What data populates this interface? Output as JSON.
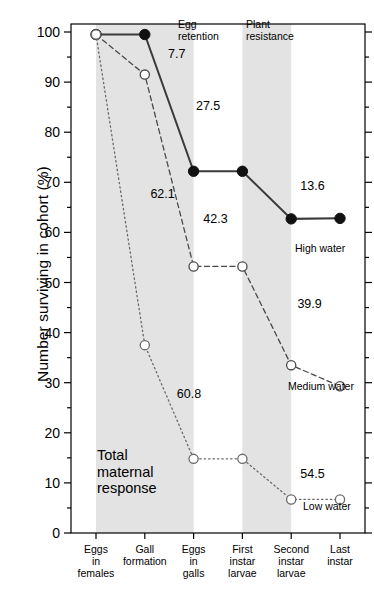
{
  "chart_data": {
    "type": "line",
    "title": "",
    "xlabel": "",
    "ylabel": "Number surviving in cohort (%)",
    "ylim": [
      0,
      100
    ],
    "ytick_step": 10,
    "yminor_step": 5,
    "grid": false,
    "legend_position": "inline-right",
    "categories": [
      "Eggs in females",
      "Gall formation",
      "Eggs in galls",
      "First instar larvae",
      "Second instar larvae",
      "Last instar"
    ],
    "category_lines": [
      [
        "Eggs",
        "in",
        "females"
      ],
      [
        "Gall",
        "formation"
      ],
      [
        "Eggs",
        "in",
        "galls"
      ],
      [
        "First",
        "instar",
        "larvae"
      ],
      [
        "Second",
        "instar",
        "larvae"
      ],
      [
        "Last",
        "instar"
      ]
    ],
    "yticks": [
      0,
      10,
      20,
      30,
      40,
      50,
      60,
      70,
      80,
      90,
      100
    ],
    "series": [
      {
        "name": "High water",
        "marker": "filled-circle",
        "line_style": "solid",
        "values": [
          99.5,
          99.5,
          72.2,
          72.2,
          62.7,
          62.8
        ],
        "label": "High water"
      },
      {
        "name": "Medium water",
        "marker": "open-circle",
        "line_style": "dashed",
        "values": [
          99.5,
          91.5,
          53.2,
          53.2,
          33.5,
          29.3
        ],
        "label": "Medium water"
      },
      {
        "name": "Low water",
        "marker": "open-circle",
        "line_style": "dotted",
        "values": [
          99.5,
          37.5,
          14.8,
          14.8,
          6.7,
          6.7
        ],
        "label": "Low water"
      }
    ],
    "annotations": [
      {
        "text": "7.7",
        "x_pct": 33.0,
        "y_value": 95.5,
        "series": "Medium water"
      },
      {
        "text": "27.5",
        "x_pct": 42.5,
        "y_value": 85.0,
        "series": "High water"
      },
      {
        "text": "62.1",
        "x_pct": 27.0,
        "y_value": 67.5,
        "series": "Low water"
      },
      {
        "text": "42.3",
        "x_pct": 45.0,
        "y_value": 62.5,
        "series": "Medium water"
      },
      {
        "text": "13.6",
        "x_pct": 78.0,
        "y_value": 69.0,
        "series": "High water"
      },
      {
        "text": "60.8",
        "x_pct": 36.0,
        "y_value": 27.5,
        "series": "Low water"
      },
      {
        "text": "39.9",
        "x_pct": 77.0,
        "y_value": 45.5,
        "series": "Medium water"
      },
      {
        "text": "54.5",
        "x_pct": 78.0,
        "y_value": 11.5,
        "series": "Low water"
      }
    ],
    "shaded_bands": [
      {
        "label": "Egg retention",
        "label_lines": [
          "Egg",
          "retention"
        ],
        "from_category": "Eggs in females",
        "to_category": "Eggs in galls"
      },
      {
        "label": "Plant resistance",
        "label_lines": [
          "Plant",
          "resistance"
        ],
        "from_category": "First instar larvae",
        "to_category": "Second instar larvae"
      }
    ],
    "inline_note": {
      "lines": [
        "Total",
        "maternal",
        "response"
      ]
    },
    "colors": {
      "band_fill": "#e3e3e3",
      "axis": "#000000",
      "high_water": "#3a3a3a",
      "medium_water": "#4a4a4a",
      "low_water": "#6a6a6a",
      "background": "#ffffff"
    }
  }
}
